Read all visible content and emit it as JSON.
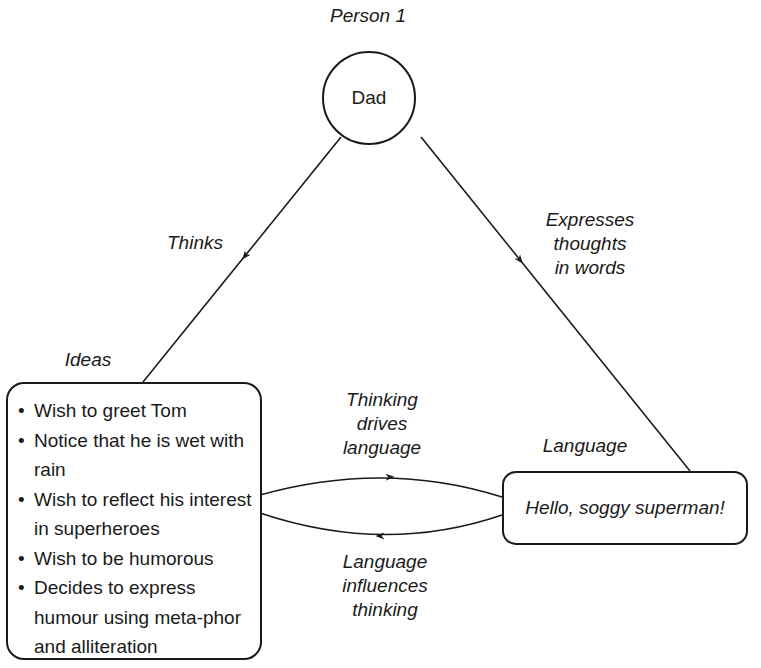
{
  "diagram": {
    "person_label": "Person 1",
    "person_node": {
      "label": "Dad"
    },
    "edges": {
      "thinks": "Thinks",
      "expresses": [
        "Expresses",
        "thoughts",
        "in words"
      ],
      "thinking_drives": [
        "Thinking",
        "drives",
        "language"
      ],
      "language_influences": [
        "Language",
        "influences",
        "thinking"
      ]
    },
    "ideas": {
      "title": "Ideas",
      "items": [
        "Wish to greet Tom",
        "Notice that he is wet with rain",
        "Wish to reflect his interest in superheroes",
        "Wish to be humorous",
        "Decides to express humour using meta-phor and alliteration"
      ]
    },
    "language": {
      "title": "Language",
      "utterance": "Hello, soggy superman!"
    },
    "colors": {
      "stroke": "#1a1a1a",
      "background": "#ffffff"
    }
  }
}
